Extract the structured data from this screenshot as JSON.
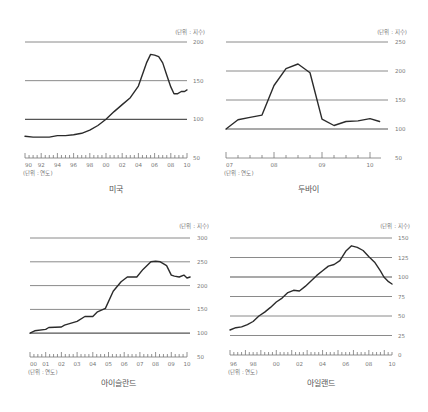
{
  "chart_data": [
    {
      "type": "line",
      "title": "미국",
      "unit_y": "(단위 : 지수)",
      "unit_x": "(단위 : 연도)",
      "x_ticks": [
        "90",
        "92",
        "94",
        "96",
        "98",
        "00",
        "02",
        "04",
        "06",
        "08",
        "10"
      ],
      "y_ticks": [
        50,
        100,
        150,
        200
      ],
      "ylim": [
        50,
        200
      ],
      "grid": true,
      "series": [
        {
          "name": "미국",
          "x": [
            1990,
            1991,
            1992,
            1993,
            1994,
            1995,
            1996,
            1997,
            1998,
            1999,
            2000,
            2001,
            2002,
            2003,
            2004,
            2005,
            2005.5,
            2006,
            2006.5,
            2007,
            2007.5,
            2008,
            2008.4,
            2008.8,
            2009.3,
            2009.7,
            2010
          ],
          "values": [
            78,
            77,
            77,
            77,
            79,
            79,
            80,
            82,
            86,
            92,
            100,
            110,
            119,
            128,
            143,
            173,
            184,
            183,
            181,
            173,
            157,
            142,
            133,
            133,
            136,
            136,
            138
          ]
        }
      ]
    },
    {
      "type": "line",
      "title": "두바이",
      "unit_y": "(단위 : 지수)",
      "unit_x": "(단위 : 연도)",
      "x_ticks": [
        "07",
        "08",
        "09",
        "10"
      ],
      "y_ticks": [
        50,
        100,
        150,
        200,
        250
      ],
      "ylim": [
        50,
        250
      ],
      "grid": true,
      "series": [
        {
          "name": "두바이",
          "x": [
            2007,
            2007.25,
            2007.5,
            2007.75,
            2008,
            2008.25,
            2008.5,
            2008.75,
            2009,
            2009.25,
            2009.5,
            2009.75,
            2010,
            2010.2
          ],
          "values": [
            100,
            116,
            120,
            124,
            175,
            204,
            212,
            197,
            117,
            106,
            113,
            114,
            118,
            113
          ]
        }
      ]
    },
    {
      "type": "line",
      "title": "아이슬란드",
      "unit_y": "(단위 : 지수)",
      "unit_x": "(단위 : 연도)",
      "x_ticks": [
        "00",
        "01",
        "02",
        "03",
        "04",
        "05",
        "06",
        "07",
        "08",
        "09",
        "10"
      ],
      "y_ticks": [
        50,
        100,
        150,
        200,
        250,
        300
      ],
      "ylim": [
        50,
        300
      ],
      "grid": true,
      "series": [
        {
          "name": "아이슬란드",
          "x": [
            2000,
            2000.3,
            2001,
            2001.2,
            2002,
            2002.2,
            2003,
            2003.5,
            2004,
            2004.3,
            2004.8,
            2005.3,
            2005.8,
            2006.2,
            2006.8,
            2007.2,
            2007.7,
            2008,
            2008.3,
            2008.7,
            2009,
            2009.2,
            2009.5,
            2009.8,
            2010,
            2010.2
          ],
          "values": [
            100,
            105,
            108,
            112,
            113,
            117,
            125,
            135,
            135,
            145,
            152,
            188,
            208,
            218,
            218,
            234,
            250,
            251,
            250,
            242,
            222,
            220,
            218,
            222,
            216,
            218
          ]
        }
      ]
    },
    {
      "type": "line",
      "title": "아일랜드",
      "unit_y": "(단위 : 지수)",
      "unit_x": "(단위 : 연도)",
      "x_ticks": [
        "96",
        "98",
        "00",
        "02",
        "04",
        "06",
        "08",
        "10"
      ],
      "y_ticks": [
        0,
        25,
        50,
        75,
        100,
        125,
        150
      ],
      "ylim": [
        0,
        150
      ],
      "grid": true,
      "series": [
        {
          "name": "아일랜드",
          "x": [
            1996,
            1996.5,
            1997,
            1997.5,
            1998,
            1998.5,
            1999,
            1999.5,
            2000,
            2000.5,
            2001,
            2001.5,
            2002,
            2002.5,
            2003,
            2003.5,
            2004,
            2004.5,
            2005,
            2005.5,
            2006,
            2006.5,
            2007,
            2007.5,
            2008,
            2008.5,
            2009,
            2009.3,
            2009.7,
            2010
          ],
          "values": [
            32,
            35,
            36,
            39,
            43,
            50,
            55,
            61,
            68,
            73,
            80,
            83,
            82,
            88,
            95,
            102,
            108,
            114,
            116,
            121,
            133,
            140,
            138,
            134,
            126,
            119,
            108,
            100,
            94,
            91
          ]
        }
      ]
    }
  ]
}
